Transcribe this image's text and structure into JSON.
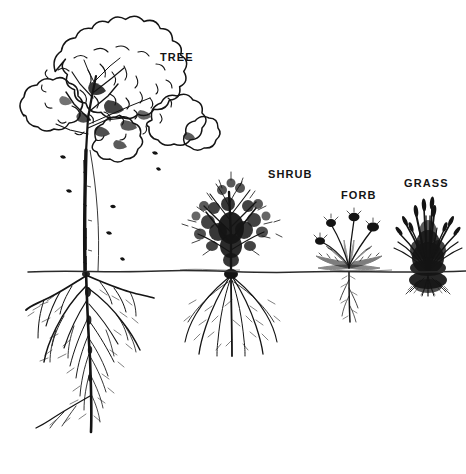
{
  "figure": {
    "width": 466,
    "height": 474,
    "background_color": "#ffffff",
    "ink_color": "#141414",
    "style": "black-and-white pen-and-ink botanical line drawing"
  },
  "ground_line": {
    "name": "soil-surface-line",
    "y": 272,
    "x_start": 28,
    "x_end": 466,
    "color": "#2b2b2b"
  },
  "labels": {
    "tree": "TREE",
    "shrub": "SHRUB",
    "forb": "FORB",
    "grass": "GRASS"
  },
  "plants": [
    {
      "id": "tree",
      "label": "TREE",
      "canopy_top": 14,
      "canopy_bottom": 152,
      "trunk_base_x": 86,
      "root_depth": 432,
      "root_type": "deep branching taproot",
      "label_x": 160,
      "label_y": 52
    },
    {
      "id": "shrub",
      "label": "SHRUB",
      "canopy_top": 183,
      "canopy_bottom": 272,
      "trunk_base_x": 231,
      "root_depth": 356,
      "root_type": "fibrous spreading roots",
      "label_x": 268,
      "label_y": 169
    },
    {
      "id": "forb",
      "label": "FORB",
      "canopy_top": 205,
      "canopy_bottom": 272,
      "trunk_base_x": 349,
      "root_depth": 322,
      "root_type": "slender taproot",
      "label_x": 341,
      "label_y": 190
    },
    {
      "id": "grass",
      "label": "GRASS",
      "canopy_top": 192,
      "canopy_bottom": 272,
      "trunk_base_x": 428,
      "root_depth": 296,
      "root_type": "dense shallow fibrous mat",
      "label_x": 404,
      "label_y": 178
    }
  ],
  "caption": {
    "cropped_text": ""
  }
}
